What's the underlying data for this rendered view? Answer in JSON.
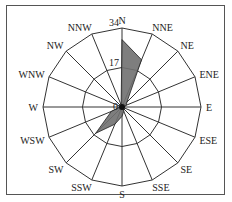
{
  "chart_data": {
    "type": "radar",
    "subtype": "wind-rose",
    "title": "",
    "categories": [
      "N",
      "NNE",
      "NE",
      "ENE",
      "E",
      "ESE",
      "SE",
      "SSE",
      "S",
      "SSW",
      "SW",
      "WSW",
      "W",
      "WNW",
      "NW",
      "NNW"
    ],
    "series": [
      {
        "name": "frequency",
        "color": "#707070",
        "values": [
          29,
          22,
          3,
          2,
          1,
          1,
          1,
          2,
          4,
          8,
          16,
          5,
          1,
          1,
          1,
          1
        ]
      }
    ],
    "radial_ticks": [
      17,
      34
    ],
    "rmax": 34,
    "grid": true,
    "legend": "none"
  }
}
